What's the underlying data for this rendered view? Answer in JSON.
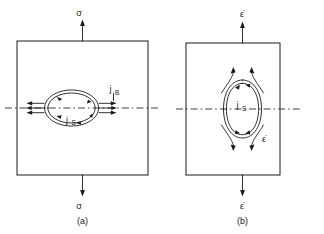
{
  "figure": {
    "background_color": "#ffffff",
    "ink_color": "#1a1a1a",
    "width": 324,
    "height": 234
  },
  "panels": [
    {
      "id": "a",
      "caption": "(a)",
      "load_symbol_top": "σ",
      "load_symbol_bottom": "σ",
      "load_symbol_name": "sigma",
      "cavity_orientation": "horizontal",
      "labels": [
        {
          "base": "j",
          "sub": "B",
          "name": "boundary-diffusion-flux"
        },
        {
          "base": "j",
          "sub": "S",
          "name": "surface-diffusion-flux"
        }
      ],
      "flux_arrows_left": 3,
      "flux_arrows_right": 3
    },
    {
      "id": "b",
      "caption": "(b)",
      "load_symbol_top": "ε̇",
      "load_symbol_bottom": "ε̇",
      "load_symbol_inner": "ε̇",
      "load_symbol_name": "epsilon-dot",
      "cavity_orientation": "vertical",
      "labels": [
        {
          "base": "j",
          "sub": "S",
          "name": "surface-diffusion-flux"
        }
      ],
      "flow_lines_top": 2,
      "flow_lines_bottom": 2
    }
  ]
}
